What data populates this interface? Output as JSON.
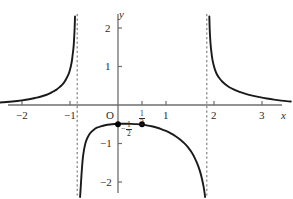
{
  "figure": {
    "title": "",
    "axis_labels": {
      "x": "x",
      "y": "y"
    },
    "origin_label": "O"
  },
  "labels": {
    "x_neg2": "−2",
    "x_neg1": "−1",
    "x_half_num": "1",
    "x_half_den": "2",
    "x_1": "1",
    "x_2": "2",
    "x_3": "3",
    "y_2": "2",
    "y_1": "1",
    "y_neg1": "−1",
    "y_neg2": "−2",
    "point_minus": "−",
    "point_half_num": "1",
    "point_half_den": "2"
  },
  "colors": {
    "curve": "#1a1a1a",
    "axis": "#6e6e6e",
    "asymptote": "#777777",
    "text": "#2b2b2b",
    "background": "#ffffff",
    "point": "#000000"
  },
  "chart_data": {
    "type": "line",
    "title": "",
    "xlabel": "x",
    "ylabel": "y",
    "xlim": [
      -2.6,
      3.6
    ],
    "ylim": [
      -2.45,
      2.45
    ],
    "grid": false,
    "legend": null,
    "x_ticks": [
      -2,
      -1,
      0.5,
      1,
      2,
      3
    ],
    "x_tick_labels": [
      "−2",
      "−1",
      "1/2",
      "1",
      "2",
      "3"
    ],
    "y_ticks": [
      2,
      1,
      -1,
      -2
    ],
    "y_tick_labels": [
      "2",
      "1",
      "−1",
      "−2"
    ],
    "asymptotes": [
      {
        "type": "vertical",
        "x": -0.85,
        "style": "dashed"
      },
      {
        "type": "vertical",
        "x": 1.85,
        "style": "dashed"
      }
    ],
    "points": [
      {
        "x": 0,
        "y": -0.5,
        "label": "−1/2",
        "marker": "filled-circle"
      },
      {
        "x": 0.5,
        "y": -0.5,
        "label": "",
        "marker": "filled-circle"
      }
    ],
    "series": [
      {
        "name": "left-branch",
        "comment": "rises from just below 0 at x=-2.6 steeply up to +2.3 near x=-0.9",
        "points": [
          [
            -2.6,
            0.05
          ],
          [
            -2.4,
            0.07
          ],
          [
            -2.2,
            0.09
          ],
          [
            -2.0,
            0.12
          ],
          [
            -1.85,
            0.15
          ],
          [
            -1.7,
            0.19
          ],
          [
            -1.6,
            0.22
          ],
          [
            -1.5,
            0.26
          ],
          [
            -1.42,
            0.3
          ],
          [
            -1.35,
            0.35
          ],
          [
            -1.28,
            0.4
          ],
          [
            -1.22,
            0.46
          ],
          [
            -1.16,
            0.53
          ],
          [
            -1.11,
            0.61
          ],
          [
            -1.07,
            0.7
          ],
          [
            -1.03,
            0.8
          ],
          [
            -1.0,
            0.92
          ],
          [
            -0.98,
            1.02
          ],
          [
            -0.96,
            1.15
          ],
          [
            -0.945,
            1.3
          ],
          [
            -0.93,
            1.45
          ],
          [
            -0.92,
            1.6
          ],
          [
            -0.912,
            1.78
          ],
          [
            -0.905,
            1.95
          ],
          [
            -0.9,
            2.12
          ],
          [
            -0.896,
            2.3
          ]
        ]
      },
      {
        "name": "middle-branch",
        "comment": "downward arch, maximum about -0.49 near x=0.25, falls to -2.4 at both asymptotes",
        "points": [
          [
            -0.79,
            -2.45
          ],
          [
            -0.775,
            -2.1
          ],
          [
            -0.76,
            -1.8
          ],
          [
            -0.745,
            -1.55
          ],
          [
            -0.73,
            -1.35
          ],
          [
            -0.71,
            -1.18
          ],
          [
            -0.69,
            -1.05
          ],
          [
            -0.66,
            -0.92
          ],
          [
            -0.62,
            -0.81
          ],
          [
            -0.57,
            -0.72
          ],
          [
            -0.51,
            -0.65
          ],
          [
            -0.44,
            -0.59
          ],
          [
            -0.36,
            -0.555
          ],
          [
            -0.27,
            -0.525
          ],
          [
            -0.17,
            -0.505
          ],
          [
            -0.06,
            -0.494
          ],
          [
            0.05,
            -0.488
          ],
          [
            0.17,
            -0.486
          ],
          [
            0.28,
            -0.489
          ],
          [
            0.39,
            -0.497
          ],
          [
            0.5,
            -0.51
          ],
          [
            0.6,
            -0.528
          ],
          [
            0.7,
            -0.552
          ],
          [
            0.8,
            -0.585
          ],
          [
            0.9,
            -0.625
          ],
          [
            1.0,
            -0.675
          ],
          [
            1.1,
            -0.735
          ],
          [
            1.2,
            -0.81
          ],
          [
            1.3,
            -0.9
          ],
          [
            1.38,
            -0.99
          ],
          [
            1.46,
            -1.1
          ],
          [
            1.54,
            -1.24
          ],
          [
            1.6,
            -1.38
          ],
          [
            1.66,
            -1.55
          ],
          [
            1.71,
            -1.73
          ],
          [
            1.75,
            -1.92
          ],
          [
            1.78,
            -2.1
          ],
          [
            1.8,
            -2.25
          ],
          [
            1.815,
            -2.45
          ]
        ]
      },
      {
        "name": "right-branch",
        "comment": "descends steeply from +2.3 just right of x=1.9 toward the x-axis at x=3.6",
        "points": [
          [
            1.903,
            2.3
          ],
          [
            1.907,
            2.1
          ],
          [
            1.912,
            1.92
          ],
          [
            1.92,
            1.74
          ],
          [
            1.93,
            1.56
          ],
          [
            1.945,
            1.38
          ],
          [
            1.965,
            1.2
          ],
          [
            1.99,
            1.05
          ],
          [
            2.02,
            0.92
          ],
          [
            2.06,
            0.8
          ],
          [
            2.11,
            0.7
          ],
          [
            2.17,
            0.61
          ],
          [
            2.24,
            0.53
          ],
          [
            2.32,
            0.46
          ],
          [
            2.42,
            0.4
          ],
          [
            2.53,
            0.34
          ],
          [
            2.66,
            0.29
          ],
          [
            2.8,
            0.245
          ],
          [
            2.95,
            0.205
          ],
          [
            3.1,
            0.17
          ],
          [
            3.25,
            0.14
          ],
          [
            3.4,
            0.115
          ],
          [
            3.55,
            0.095
          ],
          [
            3.6,
            0.09
          ]
        ]
      }
    ]
  }
}
